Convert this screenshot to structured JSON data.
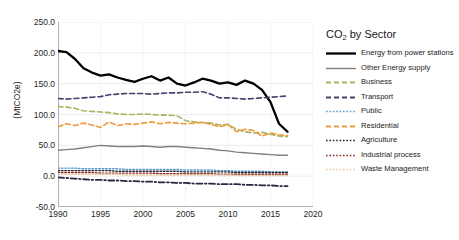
{
  "chart_data": {
    "type": "line",
    "title": "CO2 by Sector",
    "title_base": "CO",
    "title_sub": "2",
    "title_rest": " by Sector",
    "xlabel": "",
    "ylabel": "(MtCO2e)",
    "xlim": [
      1990,
      2020
    ],
    "ylim": [
      -50,
      250
    ],
    "yticks": [
      250.0,
      200.0,
      150.0,
      100.0,
      50.0,
      0.0,
      -50.0
    ],
    "ytick_labels": [
      "250.0",
      "200.0",
      "150.0",
      "100.0",
      "50.0",
      "0.0",
      "-50.0"
    ],
    "xticks": [
      1990,
      1995,
      2000,
      2005,
      2010,
      2015,
      2020
    ],
    "xtick_labels": [
      "1990",
      "1995",
      "2000",
      "2005",
      "2010",
      "2015",
      "2020"
    ],
    "grid": true,
    "legend_position": "right",
    "x": [
      1990,
      1991,
      1992,
      1993,
      1994,
      1995,
      1996,
      1997,
      1998,
      1999,
      2000,
      2001,
      2002,
      2003,
      2004,
      2005,
      2006,
      2007,
      2008,
      2009,
      2010,
      2011,
      2012,
      2013,
      2014,
      2015,
      2016,
      2017
    ],
    "series": [
      {
        "name": "Energy from power stations",
        "color": "#000000",
        "style": "solid",
        "width": 2.3,
        "values": [
          203,
          201,
          190,
          175,
          168,
          163,
          165,
          160,
          156,
          153,
          158,
          162,
          155,
          160,
          150,
          147,
          152,
          158,
          155,
          150,
          152,
          148,
          155,
          150,
          140,
          120,
          85,
          72
        ]
      },
      {
        "name": "Other Energy supply",
        "color": "#808080",
        "style": "solid",
        "width": 1.4,
        "values": [
          42,
          43,
          44,
          46,
          48,
          50,
          49,
          48,
          48,
          48,
          49,
          48,
          47,
          48,
          48,
          47,
          46,
          45,
          44,
          42,
          41,
          39,
          38,
          37,
          36,
          35,
          34,
          34
        ]
      },
      {
        "name": "Business",
        "color": "#A8B460",
        "style": "dashed",
        "width": 1.6,
        "values": [
          113,
          112,
          110,
          106,
          105,
          104,
          103,
          101,
          100,
          100,
          101,
          100,
          99,
          99,
          98,
          90,
          88,
          87,
          86,
          83,
          84,
          76,
          72,
          70,
          71,
          68,
          65,
          64
        ]
      },
      {
        "name": "Transport",
        "color": "#4A3C6B",
        "style": "dashed",
        "width": 1.6,
        "values": [
          126,
          125,
          126,
          127,
          128,
          129,
          132,
          133,
          134,
          134,
          134,
          133,
          134,
          135,
          135,
          136,
          136,
          137,
          133,
          127,
          127,
          126,
          125,
          126,
          127,
          128,
          129,
          130
        ]
      },
      {
        "name": "Public",
        "color": "#5B9BD5",
        "style": "dotted",
        "width": 1.4,
        "values": [
          13,
          13,
          13,
          12,
          12,
          12,
          12,
          12,
          11,
          11,
          11,
          11,
          11,
          11,
          11,
          10,
          10,
          10,
          10,
          9,
          9,
          8,
          8,
          8,
          8,
          7,
          7,
          7
        ]
      },
      {
        "name": "Residential",
        "color": "#ED9B3C",
        "style": "dashed",
        "width": 1.6,
        "values": [
          80,
          85,
          82,
          86,
          83,
          79,
          88,
          82,
          85,
          84,
          86,
          88,
          85,
          87,
          86,
          85,
          86,
          87,
          84,
          80,
          84,
          72,
          76,
          74,
          65,
          70,
          67,
          66
        ]
      },
      {
        "name": "Agriculture",
        "color": "#262626",
        "style": "dotted",
        "width": 1.4,
        "values": [
          9,
          9,
          9,
          9,
          9,
          9,
          9,
          8,
          8,
          8,
          8,
          8,
          8,
          8,
          8,
          7,
          7,
          7,
          7,
          7,
          7,
          6,
          6,
          6,
          6,
          6,
          6,
          6
        ]
      },
      {
        "name": "Industrial process",
        "color": "#8B2E2E",
        "style": "dotted",
        "width": 1.4,
        "values": [
          6,
          6,
          6,
          6,
          6,
          5,
          5,
          5,
          5,
          5,
          5,
          5,
          4,
          4,
          4,
          4,
          4,
          4,
          4,
          3,
          3,
          3,
          3,
          3,
          3,
          3,
          3,
          3
        ]
      },
      {
        "name": "Waste Management",
        "color": "#E8C9A0",
        "style": "dotted",
        "width": 1.4,
        "values": [
          3,
          3,
          3,
          3,
          3,
          3,
          3,
          3,
          2,
          2,
          2,
          2,
          2,
          2,
          2,
          2,
          2,
          2,
          2,
          2,
          2,
          1,
          1,
          1,
          1,
          1,
          1,
          1
        ]
      },
      {
        "name": "Land use (dash-dot)",
        "color": "#2B2640",
        "style": "dashdot",
        "width": 1.8,
        "values": [
          -2,
          -3,
          -4,
          -5,
          -6,
          -6,
          -7,
          -7,
          -8,
          -8,
          -9,
          -9,
          -10,
          -10,
          -11,
          -11,
          -12,
          -12,
          -12,
          -13,
          -13,
          -13,
          -14,
          -14,
          -15,
          -15,
          -16,
          -16
        ]
      }
    ]
  },
  "legend": {
    "title_base": "CO",
    "title_sub": "2",
    "title_rest": " by Sector",
    "items": [
      {
        "label": "Energy from power stations",
        "color": "#000000",
        "style": "solid",
        "width": 2.3
      },
      {
        "label": "Other Energy supply",
        "color": "#808080",
        "style": "solid",
        "width": 1.4
      },
      {
        "label": "Business",
        "color": "#A8B460",
        "style": "dashed",
        "width": 1.8
      },
      {
        "label": "Transport",
        "color": "#4A3C6B",
        "style": "dashed",
        "width": 1.8
      },
      {
        "label": "Public",
        "color": "#5B9BD5",
        "style": "dotted",
        "width": 1.6
      },
      {
        "label": "Residential",
        "color": "#ED9B3C",
        "style": "dashed",
        "width": 1.8
      },
      {
        "label": "Agriculture",
        "color": "#262626",
        "style": "dotted",
        "width": 1.6
      },
      {
        "label": "Industrial process",
        "color": "#8B2E2E",
        "style": "dotted",
        "width": 1.6
      },
      {
        "label": "Waste Management",
        "color": "#E8C9A0",
        "style": "dotted",
        "width": 1.6
      }
    ]
  }
}
